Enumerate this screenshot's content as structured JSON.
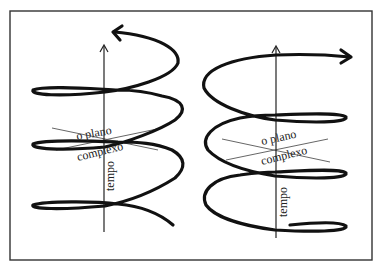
{
  "figure": {
    "frame_color": "#333333",
    "stroke_color": "#111111",
    "left_panel": {
      "plane_label_line1": "o plano",
      "plane_label_line2": "complexo",
      "axis_label": "tempo",
      "spiral_direction": "counterclockwise",
      "axis_arrow": "up-arrow"
    },
    "right_panel": {
      "plane_label_line1": "o plano",
      "plane_label_line2": "complexo",
      "axis_label": "tempo",
      "spiral_direction": "clockwise",
      "axis_arrow": "up-arrow"
    }
  }
}
